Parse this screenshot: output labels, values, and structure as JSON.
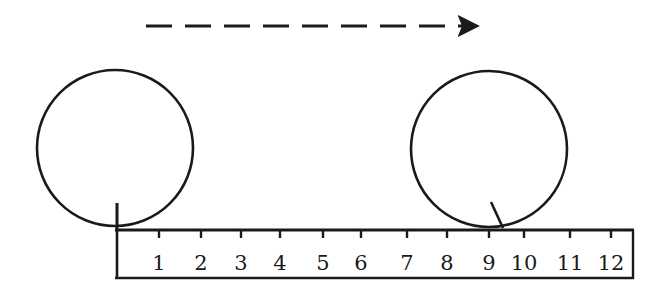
{
  "diagram": {
    "direction_arrow": {
      "from_x": 146,
      "to_x": 474,
      "y": 26,
      "style": "dashed",
      "direction": "right"
    },
    "circles": [
      {
        "id": "start",
        "cx": 115,
        "cy": 148,
        "r": 78,
        "marker": {
          "x1": 117,
          "y1": 203,
          "x2": 117,
          "y2": 230
        }
      },
      {
        "id": "end",
        "cx": 489,
        "cy": 149,
        "r": 78,
        "marker": {
          "x1": 491,
          "y1": 202,
          "x2": 503,
          "y2": 228
        }
      }
    ],
    "ruler": {
      "x": 115,
      "y": 230,
      "width": 520,
      "height": 48,
      "ticks": [
        {
          "label": "1",
          "x": 159
        },
        {
          "label": "2",
          "x": 201
        },
        {
          "label": "3",
          "x": 241
        },
        {
          "label": "4",
          "x": 280
        },
        {
          "label": "5",
          "x": 323
        },
        {
          "label": "6",
          "x": 361
        },
        {
          "label": "7",
          "x": 407
        },
        {
          "label": "8",
          "x": 447
        },
        {
          "label": "9",
          "x": 489
        },
        {
          "label": "10",
          "x": 524
        },
        {
          "label": "11",
          "x": 570
        },
        {
          "label": "12",
          "x": 611
        }
      ]
    },
    "colors": {
      "stroke": "#1a1a1a",
      "background": "#ffffff"
    }
  }
}
